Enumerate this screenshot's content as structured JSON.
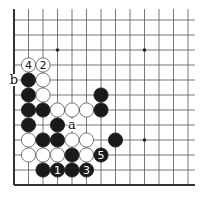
{
  "diagram": {
    "type": "go-board-fragment",
    "grid": {
      "columns": 13,
      "rows": 12,
      "origin_x": 14,
      "origin_y": 20,
      "col_spacing": 14.5,
      "row_spacing": 15,
      "top_open_y": 9,
      "right_open_x": 195,
      "left_edge": true,
      "bottom_edge": true
    },
    "colors": {
      "background": "#ffffff",
      "line": "#555555",
      "edge": "#333333",
      "black_stone": "#1a1a1a",
      "white_stone": "#ffffff",
      "white_stone_border": "#555555"
    },
    "star_points": [
      {
        "col": 3,
        "row": 2
      },
      {
        "col": 9,
        "row": 2
      },
      {
        "col": 9,
        "row": 8
      }
    ],
    "stones": [
      {
        "col": 1,
        "row": 3,
        "color": "white",
        "label": "4"
      },
      {
        "col": 2,
        "row": 3,
        "color": "white",
        "label": "2"
      },
      {
        "col": 1,
        "row": 4,
        "color": "black",
        "label": ""
      },
      {
        "col": 2,
        "row": 4,
        "color": "white",
        "label": ""
      },
      {
        "col": 1,
        "row": 5,
        "color": "black",
        "label": ""
      },
      {
        "col": 2,
        "row": 5,
        "color": "white",
        "label": ""
      },
      {
        "col": 6,
        "row": 5,
        "color": "black",
        "label": ""
      },
      {
        "col": 1,
        "row": 6,
        "color": "black",
        "label": ""
      },
      {
        "col": 2,
        "row": 6,
        "color": "black",
        "label": ""
      },
      {
        "col": 3,
        "row": 6,
        "color": "white",
        "label": ""
      },
      {
        "col": 4,
        "row": 6,
        "color": "white",
        "label": ""
      },
      {
        "col": 5,
        "row": 6,
        "color": "white",
        "label": ""
      },
      {
        "col": 6,
        "row": 6,
        "color": "black",
        "label": ""
      },
      {
        "col": 1,
        "row": 7,
        "color": "black",
        "label": ""
      },
      {
        "col": 3,
        "row": 7,
        "color": "black",
        "label": ""
      },
      {
        "col": 1,
        "row": 8,
        "color": "white",
        "label": ""
      },
      {
        "col": 2,
        "row": 8,
        "color": "black",
        "label": ""
      },
      {
        "col": 3,
        "row": 8,
        "color": "black",
        "label": ""
      },
      {
        "col": 4,
        "row": 8,
        "color": "white",
        "label": ""
      },
      {
        "col": 5,
        "row": 8,
        "color": "white",
        "label": ""
      },
      {
        "col": 7,
        "row": 8,
        "color": "black",
        "label": ""
      },
      {
        "col": 1,
        "row": 9,
        "color": "white",
        "label": ""
      },
      {
        "col": 2,
        "row": 9,
        "color": "white",
        "label": ""
      },
      {
        "col": 3,
        "row": 9,
        "color": "white",
        "label": ""
      },
      {
        "col": 4,
        "row": 9,
        "color": "black",
        "label": ""
      },
      {
        "col": 5,
        "row": 9,
        "color": "white",
        "label": ""
      },
      {
        "col": 6,
        "row": 9,
        "color": "black",
        "label": "5"
      },
      {
        "col": 2,
        "row": 10,
        "color": "black",
        "label": ""
      },
      {
        "col": 3,
        "row": 10,
        "color": "black",
        "label": "1"
      },
      {
        "col": 4,
        "row": 10,
        "color": "black",
        "label": ""
      },
      {
        "col": 5,
        "row": 10,
        "color": "black",
        "label": "3"
      }
    ],
    "point_labels": [
      {
        "col": 0,
        "row": 4,
        "text": "b"
      },
      {
        "col": 4,
        "row": 7,
        "text": "a"
      }
    ]
  }
}
